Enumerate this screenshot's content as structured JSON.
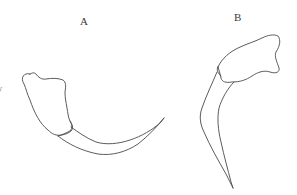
{
  "figure": {
    "panels": [
      {
        "id": "A",
        "label": "A"
      },
      {
        "id": "B",
        "label": "B"
      }
    ],
    "cropped_left_text": [
      ".",
      "y"
    ],
    "line_color": "#4a4a4a",
    "background": "#ffffff"
  }
}
